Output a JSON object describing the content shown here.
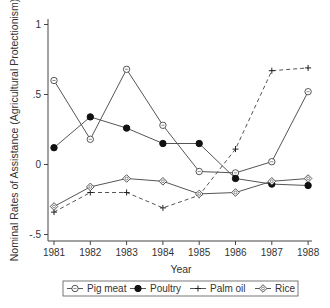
{
  "chart_data": {
    "type": "line",
    "title": "",
    "xlabel": "Year",
    "ylabel": "Nominal Rates of Assistance (Agricultural Protectionism)",
    "x": [
      1981,
      1982,
      1983,
      1984,
      1985,
      1986,
      1987,
      1988
    ],
    "x_tick_labels": [
      "1981",
      "1982",
      "1983",
      "1984",
      "1985",
      "1986",
      "1987",
      "1988"
    ],
    "y_ticks": [
      1,
      0.5,
      0,
      -0.5
    ],
    "y_tick_labels": [
      "1",
      ".5",
      "0",
      "-.5"
    ],
    "ylim": [
      -0.52,
      1.04
    ],
    "grid": false,
    "legend_position": "bottom",
    "series": [
      {
        "name": "Pig meat",
        "marker": "open-circle",
        "line": "solid",
        "values": [
          0.6,
          0.18,
          0.68,
          0.28,
          -0.05,
          -0.06,
          0.02,
          0.52
        ]
      },
      {
        "name": "Poultry",
        "marker": "filled-circle",
        "line": "solid",
        "values": [
          0.12,
          0.34,
          0.26,
          0.15,
          0.15,
          -0.1,
          -0.14,
          -0.15
        ]
      },
      {
        "name": "Palm oil",
        "marker": "plus",
        "line": "dashed",
        "values": [
          -0.34,
          -0.2,
          -0.2,
          -0.31,
          -0.22,
          0.11,
          0.67,
          0.69
        ]
      },
      {
        "name": "Rice",
        "marker": "open-diamond",
        "line": "solid",
        "values": [
          -0.3,
          -0.16,
          -0.1,
          -0.12,
          -0.21,
          -0.2,
          -0.12,
          -0.1
        ]
      }
    ]
  },
  "legend": {
    "items": [
      "Pig meat",
      "Poultry",
      "Palm oil",
      "Rice"
    ]
  }
}
